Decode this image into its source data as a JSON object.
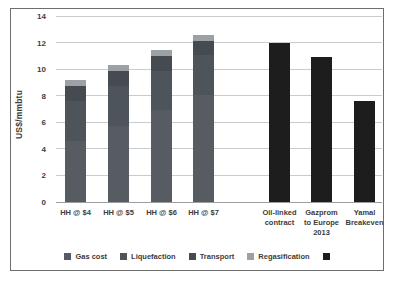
{
  "figure": {
    "background": "#ffffff",
    "border_color": "#6e6e6e"
  },
  "chart_data": {
    "type": "bar",
    "stacked": true,
    "title": "",
    "xlabel": "",
    "ylabel": "US$/mmbtu",
    "ylim": [
      0,
      14
    ],
    "yticks": [
      0,
      2,
      4,
      6,
      8,
      10,
      12,
      14
    ],
    "grid": true,
    "legend_position": "bottom",
    "categories": [
      "HH @ $4",
      "HH @ $5",
      "HH @ $6",
      "HH @ $7",
      "Oil-linked\ncontract",
      "Gazprom\nto Europe\n2013",
      "Yamal\nBreakeven"
    ],
    "series": [
      {
        "name": "Gas cost",
        "color": "#565c61",
        "values": [
          4.6,
          5.75,
          6.9,
          8.05,
          0,
          0,
          0
        ]
      },
      {
        "name": "Liquefaction",
        "color": "#4e555a",
        "values": [
          3.0,
          3.0,
          3.0,
          3.0,
          0,
          0,
          0
        ]
      },
      {
        "name": "Transport",
        "color": "#454b50",
        "values": [
          1.1,
          1.1,
          1.1,
          1.1,
          0,
          0,
          0
        ]
      },
      {
        "name": "Regasification",
        "color": "#9ba1a5",
        "values": [
          0.45,
          0.45,
          0.45,
          0.45,
          0,
          0,
          0
        ]
      },
      {
        "name": "",
        "color": "#1d1d1d",
        "values": [
          0,
          0,
          0,
          0,
          12.0,
          10.9,
          7.6
        ]
      }
    ],
    "totals": [
      9.15,
      10.3,
      11.45,
      12.6,
      12.0,
      10.9,
      7.6
    ],
    "colors": {
      "gridline": "#c9ccce",
      "axis_line": "#9b9ea1",
      "text": "#3c3c3c"
    },
    "layout_hints": {
      "plot": {
        "left": 45,
        "top": 8,
        "width": 326,
        "height": 186
      },
      "bar_width": 21,
      "bar_x": [
        9,
        52,
        95,
        137,
        213,
        255,
        298
      ]
    }
  }
}
